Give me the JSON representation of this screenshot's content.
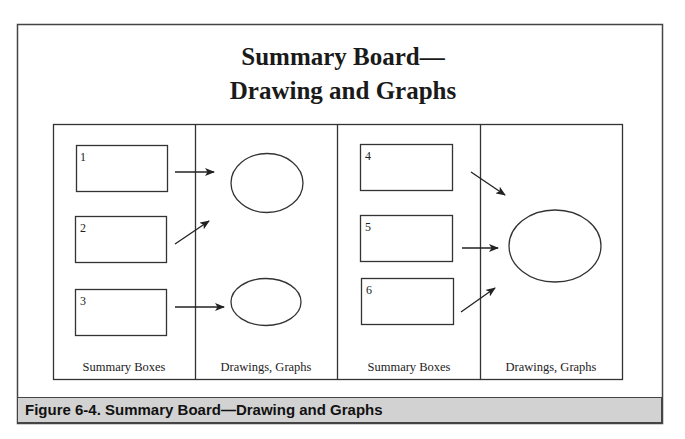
{
  "title": {
    "line1": "Summary Board—",
    "line2": "Drawing and Graphs"
  },
  "panels": [
    {
      "label": "Summary Boxes"
    },
    {
      "label": "Drawings, Graphs"
    },
    {
      "label": "Summary Boxes"
    },
    {
      "label": "Drawings, Graphs"
    }
  ],
  "boxes": [
    {
      "number": "1"
    },
    {
      "number": "2"
    },
    {
      "number": "3"
    },
    {
      "number": "4"
    },
    {
      "number": "5"
    },
    {
      "number": "6"
    }
  ],
  "caption": "Figure 6-4. Summary Board—Drawing and Graphs",
  "colors": {
    "stroke": "#333333",
    "caption_bg": "#d2d2d2"
  }
}
